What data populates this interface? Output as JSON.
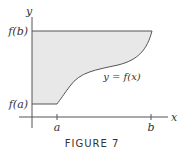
{
  "figure": {
    "caption": "FIGURE 7",
    "axes": {
      "x_label": "x",
      "y_label": "y"
    },
    "x_ticks": [
      "a",
      "b"
    ],
    "y_ticks": [
      "f(a)",
      "f(b)"
    ],
    "curve_label": "y = f(x)",
    "colors": {
      "fill": "#e8e8e8",
      "stroke": "#555555",
      "text": "#333333"
    }
  }
}
